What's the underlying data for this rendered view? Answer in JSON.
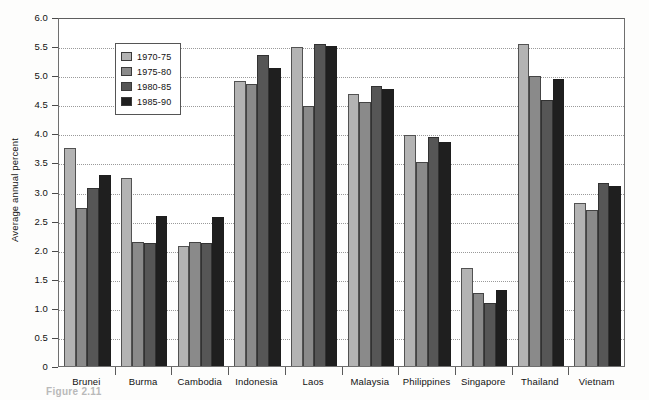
{
  "chart_data": {
    "type": "bar",
    "title": "",
    "xlabel": "",
    "ylabel": "Average annual percent",
    "ylim": [
      0,
      6.0
    ],
    "ytick_labels": [
      "6.0",
      "5.5",
      "5.0",
      "4.5",
      "4.0",
      "3.5",
      "3.0",
      "2.5",
      "2.0",
      "1.5",
      "1.0",
      "0.5",
      "0"
    ],
    "ytick_values": [
      6.0,
      5.5,
      5.0,
      4.5,
      4.0,
      3.5,
      3.0,
      2.5,
      2.0,
      1.5,
      1.0,
      0.5,
      0
    ],
    "grid": true,
    "legend_position": "upper-left-inside",
    "categories": [
      "Brunei",
      "Burma",
      "Cambodia",
      "Indonesia",
      "Laos",
      "Malaysia",
      "Philippines",
      "Singapore",
      "Thailand",
      "Vietnam"
    ],
    "series": [
      {
        "name": "1970-75",
        "color": "#b3b3b3",
        "values": [
          3.74,
          3.24,
          2.07,
          4.9,
          5.49,
          4.67,
          3.98,
          1.68,
          5.53,
          2.81
        ]
      },
      {
        "name": "1975-80",
        "color": "#8a8a8a",
        "values": [
          2.72,
          2.14,
          2.13,
          4.85,
          4.47,
          4.54,
          3.5,
          1.25,
          4.99,
          2.68
        ]
      },
      {
        "name": "1980-85",
        "color": "#565656",
        "values": [
          3.06,
          2.12,
          2.11,
          5.34,
          5.54,
          4.82,
          3.93,
          1.09,
          4.58,
          3.15
        ]
      },
      {
        "name": "1985-90",
        "color": "#1f1f1f",
        "values": [
          3.29,
          2.58,
          2.57,
          5.13,
          5.51,
          4.76,
          3.85,
          1.31,
          4.93,
          3.09
        ]
      }
    ]
  },
  "legend": {
    "items": [
      {
        "label": "1970-75",
        "color": "#b3b3b3"
      },
      {
        "label": "1975-80",
        "color": "#8a8a8a"
      },
      {
        "label": "1980-85",
        "color": "#565656"
      },
      {
        "label": "1985-90",
        "color": "#1f1f1f"
      }
    ]
  },
  "caption": {
    "text": "Figure 2.11"
  },
  "colors": {
    "frame": "#6f6f6f",
    "grid": "#9a9a9a",
    "text": "#111111",
    "background": "#ffffff"
  }
}
